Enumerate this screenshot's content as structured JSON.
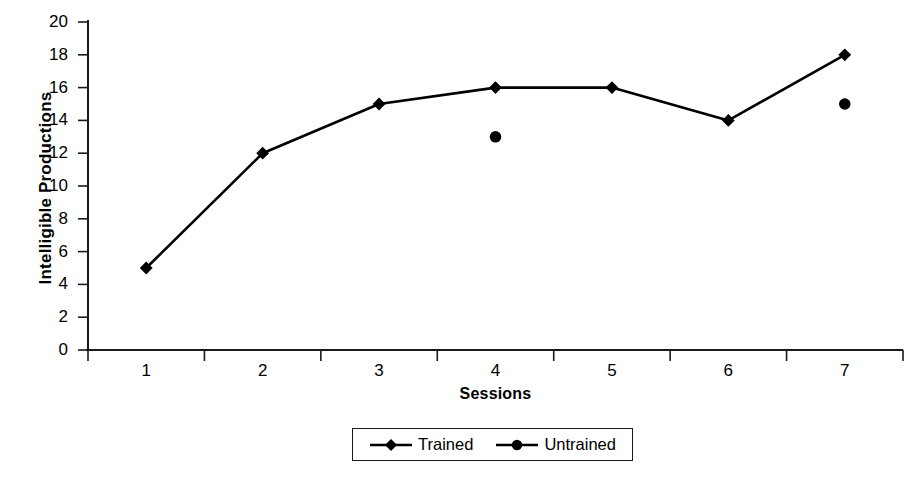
{
  "chart_data": {
    "type": "line",
    "title": "",
    "subtitle": "",
    "xlabel": "Sessions",
    "ylabel": "Intelligible Productions",
    "categories": [
      "1",
      "2",
      "3",
      "4",
      "5",
      "6",
      "7"
    ],
    "x": [
      1,
      2,
      3,
      4,
      5,
      6,
      7
    ],
    "ylim": [
      0,
      20
    ],
    "ytick_labels": [
      "20",
      "18",
      "16",
      "14",
      "12",
      "10",
      "8",
      "6",
      "4",
      "2",
      "0"
    ],
    "ytick_values": [
      20,
      18,
      16,
      14,
      12,
      10,
      8,
      6,
      4,
      2,
      0
    ],
    "xtick_labels": [
      "1",
      "2",
      "3",
      "4",
      "5",
      "6",
      "7"
    ],
    "grid": false,
    "legend_position": "bottom-center",
    "series": [
      {
        "name": "Trained",
        "marker": "diamond",
        "line": true,
        "color": "#000000",
        "values": [
          5,
          12,
          15,
          16,
          16,
          14,
          18
        ]
      },
      {
        "name": "Untrained",
        "marker": "circle",
        "line": false,
        "color": "#000000",
        "values": [
          null,
          null,
          null,
          13,
          null,
          null,
          15
        ]
      }
    ],
    "annotations": []
  },
  "axes": {
    "y_title": "Intelligible Productions",
    "x_title": "Sessions"
  },
  "legend": {
    "entries": [
      {
        "label": "Trained",
        "marker": "diamond-marker-icon"
      },
      {
        "label": "Untrained",
        "marker": "circle-marker-icon"
      }
    ]
  },
  "colors": {
    "ink": "#1a1a1a",
    "series": "#000000",
    "background": "#ffffff"
  }
}
